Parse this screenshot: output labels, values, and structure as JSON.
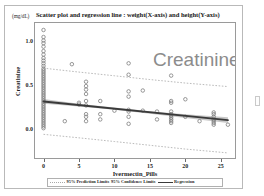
{
  "figure": {
    "title": "Scatter plot and regression line : weight(X-axis) and height(Y-axis)",
    "unit_label": "(mg/dL)",
    "watermark": "Creatinine"
  },
  "legend": {
    "prediction_label": "95% Prediction Limits",
    "separator": "95% Confidence Limits",
    "regression_label": "Regression"
  },
  "colors": {
    "regression_line": "#3a3a3a",
    "confidence_band": "#b4b4b4",
    "prediction_limits": "#a9a9a9",
    "point_marker": "#7d7d7d",
    "axis": "#9a9a9a",
    "watermark_text": "#8c8c8c",
    "frame": "#b9b9b9"
  },
  "chart_data": {
    "type": "scatter",
    "title": "Scatter plot and regression line : weight(X-axis) and height(Y-axis)",
    "xlabel": "Ivermectin_Pills",
    "ylabel": "Creatinine",
    "yunit": "(mg/dL)",
    "xlim": [
      -1.2,
      27
    ],
    "ylim": [
      -0.32,
      1.22
    ],
    "xticks": [
      0,
      5,
      10,
      15,
      20,
      25
    ],
    "xtick_labels": [
      "0",
      "5",
      "10",
      "15",
      "20",
      "25"
    ],
    "yticks": [
      0.0,
      0.5,
      1.0
    ],
    "ytick_labels": [
      "0.0",
      "0.5",
      "1.0"
    ],
    "grid": false,
    "legend_position": "bottom",
    "regression": {
      "name": "Regression",
      "intercept": 0.325,
      "slope": -0.0082,
      "x_start": 0,
      "x_end": 26
    },
    "confidence_limits": {
      "name": "95% Confidence Limits",
      "level": 95,
      "upper": [
        {
          "x": 0,
          "y": 0.352
        },
        {
          "x": 5,
          "y": 0.3
        },
        {
          "x": 10,
          "y": 0.255
        },
        {
          "x": 15,
          "y": 0.213
        },
        {
          "x": 20,
          "y": 0.178
        },
        {
          "x": 26,
          "y": 0.146
        }
      ],
      "lower": [
        {
          "x": 0,
          "y": 0.298
        },
        {
          "x": 5,
          "y": 0.268
        },
        {
          "x": 10,
          "y": 0.23
        },
        {
          "x": 15,
          "y": 0.184
        },
        {
          "x": 20,
          "y": 0.135
        },
        {
          "x": 26,
          "y": 0.078
        }
      ]
    },
    "prediction_limits": {
      "name": "95% Prediction Limits",
      "level": 95,
      "upper": [
        {
          "x": 0,
          "y": 0.705
        },
        {
          "x": 5,
          "y": 0.66
        },
        {
          "x": 10,
          "y": 0.618
        },
        {
          "x": 15,
          "y": 0.575
        },
        {
          "x": 20,
          "y": 0.535
        },
        {
          "x": 26,
          "y": 0.495
        }
      ],
      "lower": [
        {
          "x": 0,
          "y": -0.05
        },
        {
          "x": 5,
          "y": -0.09
        },
        {
          "x": 10,
          "y": -0.132
        },
        {
          "x": 15,
          "y": -0.175
        },
        {
          "x": 20,
          "y": -0.218
        },
        {
          "x": 26,
          "y": -0.262
        }
      ]
    },
    "series": [
      {
        "name": "Creatinine",
        "marker": "open-circle",
        "points": [
          {
            "x": 0,
            "y": 1.14
          },
          {
            "x": 0,
            "y": 1.06
          },
          {
            "x": 0,
            "y": 1.02
          },
          {
            "x": 0,
            "y": 0.99
          },
          {
            "x": 0,
            "y": 0.95
          },
          {
            "x": 0,
            "y": 0.9
          },
          {
            "x": 0,
            "y": 0.86
          },
          {
            "x": 0,
            "y": 0.82
          },
          {
            "x": 0,
            "y": 0.79
          },
          {
            "x": 0,
            "y": 0.76
          },
          {
            "x": 0,
            "y": 0.73
          },
          {
            "x": 0,
            "y": 0.7
          },
          {
            "x": 0,
            "y": 0.68
          },
          {
            "x": 0,
            "y": 0.66
          },
          {
            "x": 0,
            "y": 0.64
          },
          {
            "x": 0,
            "y": 0.62
          },
          {
            "x": 0,
            "y": 0.6
          },
          {
            "x": 0,
            "y": 0.58
          },
          {
            "x": 0,
            "y": 0.56
          },
          {
            "x": 0,
            "y": 0.54
          },
          {
            "x": 0,
            "y": 0.52
          },
          {
            "x": 0,
            "y": 0.5
          },
          {
            "x": 0,
            "y": 0.48
          },
          {
            "x": 0,
            "y": 0.46
          },
          {
            "x": 0,
            "y": 0.44
          },
          {
            "x": 0,
            "y": 0.42
          },
          {
            "x": 0,
            "y": 0.4
          },
          {
            "x": 0,
            "y": 0.38
          },
          {
            "x": 0,
            "y": 0.36
          },
          {
            "x": 0,
            "y": 0.34
          },
          {
            "x": 0,
            "y": 0.32
          },
          {
            "x": 0,
            "y": 0.3
          },
          {
            "x": 0,
            "y": 0.28
          },
          {
            "x": 0,
            "y": 0.26
          },
          {
            "x": 0,
            "y": 0.24
          },
          {
            "x": 0,
            "y": 0.22
          },
          {
            "x": 0,
            "y": 0.2
          },
          {
            "x": 0,
            "y": 0.18
          },
          {
            "x": 0,
            "y": 0.16
          },
          {
            "x": 0,
            "y": 0.14
          },
          {
            "x": 0,
            "y": 0.12
          },
          {
            "x": 0,
            "y": 0.1
          },
          {
            "x": 0,
            "y": 0.08
          },
          {
            "x": 0,
            "y": 0.06
          },
          {
            "x": 0,
            "y": 0.04
          },
          {
            "x": 0,
            "y": 0.02
          },
          {
            "x": 3,
            "y": 0.1
          },
          {
            "x": 4,
            "y": 0.75
          },
          {
            "x": 5,
            "y": 0.31
          },
          {
            "x": 5,
            "y": 0.29
          },
          {
            "x": 6,
            "y": 0.55
          },
          {
            "x": 6,
            "y": 0.5
          },
          {
            "x": 6,
            "y": 0.46
          },
          {
            "x": 6,
            "y": 0.41
          },
          {
            "x": 6,
            "y": 0.33
          },
          {
            "x": 6,
            "y": 0.28
          },
          {
            "x": 6,
            "y": 0.18
          },
          {
            "x": 6,
            "y": 0.15
          },
          {
            "x": 6,
            "y": 0.1
          },
          {
            "x": 8,
            "y": 0.33
          },
          {
            "x": 8,
            "y": 0.18
          },
          {
            "x": 8,
            "y": 0.12
          },
          {
            "x": 10,
            "y": 0.22
          },
          {
            "x": 12,
            "y": 0.76
          },
          {
            "x": 12,
            "y": 0.63
          },
          {
            "x": 12,
            "y": 0.44
          },
          {
            "x": 12,
            "y": 0.38
          },
          {
            "x": 12,
            "y": 0.23
          },
          {
            "x": 12,
            "y": 0.21
          },
          {
            "x": 12,
            "y": 0.15
          },
          {
            "x": 12,
            "y": 0.07
          },
          {
            "x": 14,
            "y": 0.45
          },
          {
            "x": 14,
            "y": 0.22
          },
          {
            "x": 16,
            "y": 0.21
          },
          {
            "x": 16,
            "y": 0.12
          },
          {
            "x": 18,
            "y": 0.62
          },
          {
            "x": 18,
            "y": 0.33
          },
          {
            "x": 18,
            "y": 0.31
          },
          {
            "x": 18,
            "y": 0.21
          },
          {
            "x": 18,
            "y": 0.18
          },
          {
            "x": 18,
            "y": 0.16
          },
          {
            "x": 18,
            "y": 0.14
          },
          {
            "x": 18,
            "y": 0.12
          },
          {
            "x": 18,
            "y": 0.1
          },
          {
            "x": 18,
            "y": 0.08
          },
          {
            "x": 20,
            "y": 0.35
          },
          {
            "x": 20,
            "y": 0.15
          },
          {
            "x": 22,
            "y": 0.1
          },
          {
            "x": 24,
            "y": 0.2
          },
          {
            "x": 24,
            "y": 0.18
          },
          {
            "x": 24,
            "y": 0.15
          },
          {
            "x": 24,
            "y": 0.12
          },
          {
            "x": 24,
            "y": 0.1
          },
          {
            "x": 24,
            "y": 0.08
          },
          {
            "x": 24,
            "y": 0.06
          },
          {
            "x": 26,
            "y": 0.06
          }
        ]
      }
    ]
  }
}
